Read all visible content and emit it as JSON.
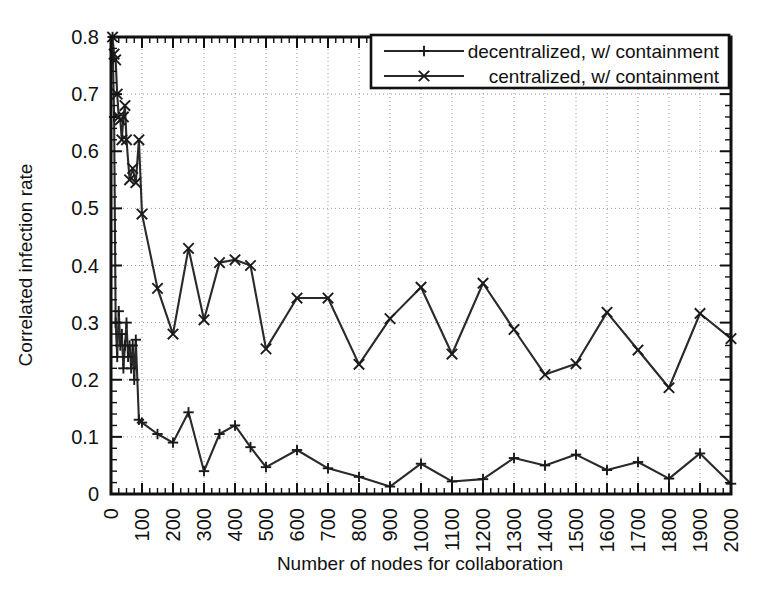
{
  "chart_data": {
    "type": "line",
    "title": "",
    "xlabel": "Number of nodes for collaboration",
    "ylabel": "Correlated infection rate",
    "xlim": [
      0,
      2000
    ],
    "ylim": [
      0,
      0.8
    ],
    "grid": true,
    "legend_position": "top-right",
    "x_tick_labels": [
      "0",
      "100",
      "200",
      "300",
      "400",
      "500",
      "600",
      "700",
      "800",
      "900",
      "1000",
      "1100",
      "1200",
      "1300",
      "1400",
      "1500",
      "1600",
      "1700",
      "1800",
      "1900",
      "2000"
    ],
    "x_tick_values": [
      0,
      100,
      200,
      300,
      400,
      500,
      600,
      700,
      800,
      900,
      1000,
      1100,
      1200,
      1300,
      1400,
      1500,
      1600,
      1700,
      1800,
      1900,
      2000
    ],
    "y_tick_labels": [
      "0",
      "0.1",
      "0.2",
      "0.3",
      "0.4",
      "0.5",
      "0.6",
      "0.7",
      "0.8"
    ],
    "y_tick_values": [
      0,
      0.1,
      0.2,
      0.3,
      0.4,
      0.5,
      0.6,
      0.7,
      0.8
    ],
    "series": [
      {
        "name": "decentralized, w/ containment",
        "marker": "plus",
        "x": [
          5,
          10,
          15,
          20,
          25,
          30,
          35,
          40,
          45,
          50,
          55,
          60,
          65,
          70,
          75,
          80,
          90,
          100,
          150,
          200,
          250,
          300,
          350,
          400,
          450,
          500,
          600,
          700,
          800,
          900,
          1000,
          1100,
          1200,
          1300,
          1400,
          1500,
          1600,
          1700,
          1800,
          1900,
          2000
        ],
        "y": [
          0.8,
          0.66,
          0.3,
          0.24,
          0.32,
          0.26,
          0.28,
          0.22,
          0.26,
          0.3,
          0.24,
          0.26,
          0.22,
          0.26,
          0.2,
          0.27,
          0.13,
          0.125,
          0.105,
          0.09,
          0.143,
          0.04,
          0.105,
          0.12,
          0.082,
          0.047,
          0.077,
          0.045,
          0.03,
          0.013,
          0.053,
          0.022,
          0.026,
          0.063,
          0.05,
          0.069,
          0.042,
          0.056,
          0.027,
          0.071,
          0.018
        ]
      },
      {
        "name": "centralized, w/ containment",
        "marker": "cross",
        "x": [
          5,
          10,
          15,
          20,
          25,
          30,
          35,
          40,
          45,
          50,
          60,
          70,
          80,
          90,
          100,
          150,
          200,
          250,
          300,
          350,
          400,
          450,
          500,
          600,
          700,
          800,
          900,
          1000,
          1100,
          1200,
          1300,
          1400,
          1500,
          1600,
          1700,
          1800,
          1900,
          2000
        ],
        "y": [
          0.8,
          0.77,
          0.76,
          0.7,
          0.66,
          0.655,
          0.62,
          0.66,
          0.68,
          0.62,
          0.55,
          0.57,
          0.545,
          0.62,
          0.49,
          0.36,
          0.28,
          0.43,
          0.305,
          0.405,
          0.41,
          0.4,
          0.254,
          0.343,
          0.343,
          0.227,
          0.307,
          0.362,
          0.245,
          0.369,
          0.288,
          0.209,
          0.228,
          0.318,
          0.252,
          0.186,
          0.316,
          0.272
        ]
      }
    ]
  },
  "legend": {
    "entries": [
      {
        "label": "decentralized, w/ containment",
        "marker": "plus"
      },
      {
        "label": "centralized, w/ containment",
        "marker": "cross"
      }
    ]
  },
  "axes": {
    "x_title": "Number of nodes for collaboration",
    "y_title": "Correlated infection rate"
  }
}
